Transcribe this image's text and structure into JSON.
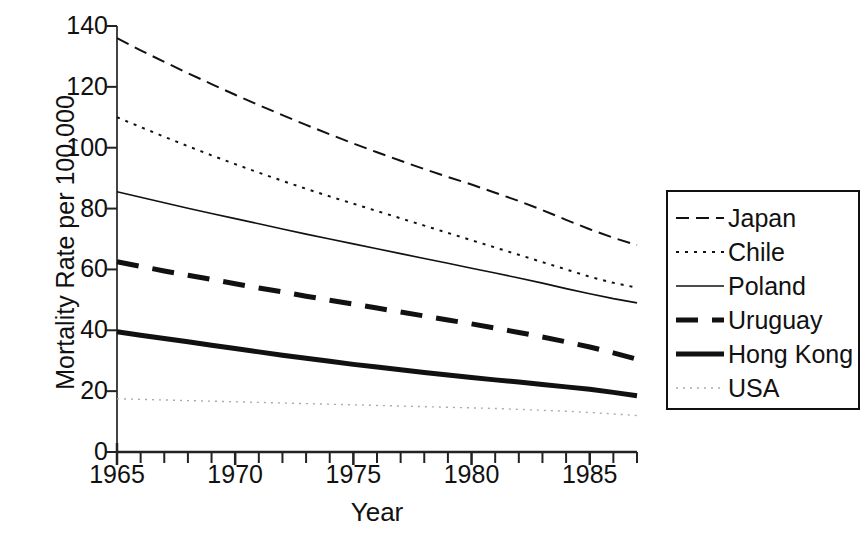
{
  "chart_data": {
    "type": "line",
    "title": "",
    "xlabel": "Year",
    "ylabel": "Mortality Rate per 100,000",
    "xlim": [
      1965,
      1987
    ],
    "ylim": [
      0,
      140
    ],
    "grid": false,
    "legend_position": "right",
    "x": [
      1965,
      1966,
      1967,
      1968,
      1969,
      1970,
      1971,
      1972,
      1973,
      1974,
      1975,
      1976,
      1977,
      1978,
      1979,
      1980,
      1981,
      1982,
      1983,
      1984,
      1985,
      1986,
      1987
    ],
    "xticks": [
      1965,
      1970,
      1975,
      1980,
      1985
    ],
    "xticklabels": [
      "1965",
      "1970",
      "1975",
      "1980",
      "1985"
    ],
    "xminor_step": 1,
    "yticks": [
      0,
      20,
      40,
      60,
      80,
      100,
      120,
      140
    ],
    "yticklabels": [
      "0",
      "20",
      "40",
      "60",
      "80",
      "100",
      "120",
      "140"
    ],
    "series": [
      {
        "name": "Japan",
        "style": "dashed",
        "width": 2,
        "color": "#111111",
        "values": [
          136.0,
          132.0,
          128.2,
          124.5,
          120.9,
          117.4,
          114.0,
          110.7,
          107.5,
          104.4,
          101.4,
          98.5,
          95.7,
          93.0,
          90.4,
          87.9,
          85.2,
          82.5,
          79.5,
          76.3,
          73.2,
          70.4,
          68.0
        ]
      },
      {
        "name": "Chile",
        "style": "dotted",
        "width": 2,
        "color": "#111111",
        "values": [
          110.0,
          106.8,
          103.6,
          100.5,
          97.5,
          94.6,
          91.8,
          89.1,
          86.5,
          84.0,
          81.6,
          79.2,
          76.8,
          74.4,
          72.0,
          69.6,
          67.2,
          64.8,
          62.4,
          60.0,
          57.6,
          55.6,
          54.0
        ]
      },
      {
        "name": "Poland",
        "style": "solid",
        "width": 1.6,
        "color": "#111111",
        "values": [
          85.5,
          83.7,
          81.9,
          80.1,
          78.4,
          76.7,
          75.0,
          73.3,
          71.6,
          70.0,
          68.4,
          66.8,
          65.2,
          63.6,
          62.0,
          60.4,
          58.8,
          57.2,
          55.5,
          53.7,
          52.0,
          50.4,
          49.0
        ]
      },
      {
        "name": "Uruguay",
        "style": "dashed-thick",
        "width": 5,
        "color": "#111111",
        "values": [
          62.5,
          61.0,
          59.5,
          58.1,
          56.7,
          55.3,
          53.9,
          52.6,
          51.2,
          49.9,
          48.6,
          47.3,
          46.0,
          44.7,
          43.4,
          42.1,
          40.7,
          39.3,
          37.8,
          36.2,
          34.5,
          32.6,
          30.5
        ]
      },
      {
        "name": "Hong Kong",
        "style": "solid-thick",
        "width": 5,
        "color": "#111111",
        "values": [
          39.5,
          38.4,
          37.3,
          36.2,
          35.1,
          34.0,
          32.9,
          31.8,
          30.8,
          29.8,
          28.8,
          27.9,
          27.0,
          26.1,
          25.3,
          24.5,
          23.7,
          23.0,
          22.2,
          21.4,
          20.6,
          19.6,
          18.5
        ]
      },
      {
        "name": "USA",
        "style": "dotted-faint",
        "width": 1.4,
        "color": "#aaaaaa",
        "values": [
          17.5,
          17.3,
          17.1,
          16.9,
          16.7,
          16.5,
          16.3,
          16.1,
          15.9,
          15.7,
          15.5,
          15.3,
          15.1,
          14.9,
          14.7,
          14.5,
          14.3,
          14.0,
          13.7,
          13.4,
          13.0,
          12.5,
          12.0
        ]
      }
    ]
  },
  "legend": {
    "items": [
      {
        "label": "Japan",
        "style": "dashed"
      },
      {
        "label": "Chile",
        "style": "dotted"
      },
      {
        "label": "Poland",
        "style": "solid"
      },
      {
        "label": "Uruguay",
        "style": "dashed-thick"
      },
      {
        "label": "Hong Kong",
        "style": "solid-thick"
      },
      {
        "label": "USA",
        "style": "dotted-faint"
      }
    ]
  }
}
